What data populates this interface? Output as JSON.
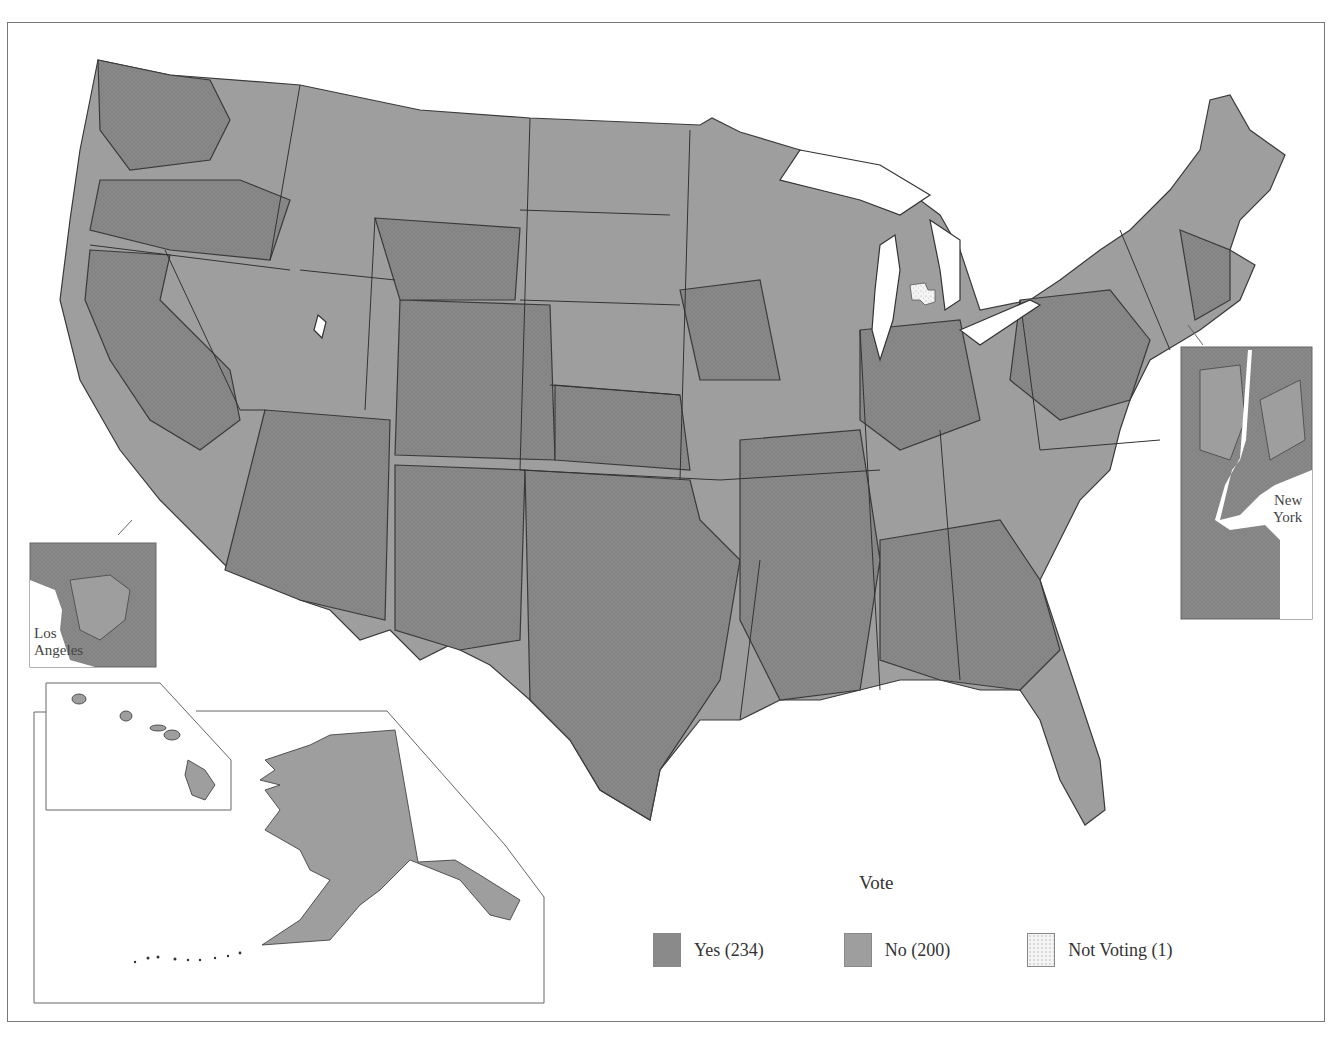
{
  "map": {
    "subject": "U.S. House roll-call vote by congressional district",
    "legend": {
      "title": "Vote",
      "items": [
        {
          "key": "yes",
          "label": "Yes (234)",
          "count": 234,
          "color": "#8a8a8a",
          "pattern": "crosshatch"
        },
        {
          "key": "no",
          "label": "No (200)",
          "count": 200,
          "color": "#9e9e9e",
          "pattern": "solid"
        },
        {
          "key": "not_voting",
          "label": "Not Voting (1)",
          "count": 1,
          "color": "#f2f2f2",
          "pattern": "stipple"
        }
      ]
    },
    "insets": {
      "los_angeles": {
        "label_line1": "Los",
        "label_line2": "Angeles"
      },
      "new_york": {
        "label_line1": "New",
        "label_line2": "York"
      },
      "alaska_hawaii": {
        "label": ""
      }
    },
    "colors": {
      "yes_fill": "#8a8a8a",
      "no_fill": "#9e9e9e",
      "not_voting_fill": "#f2f2f2",
      "border": "#3a3a3a",
      "water": "#ffffff"
    }
  }
}
